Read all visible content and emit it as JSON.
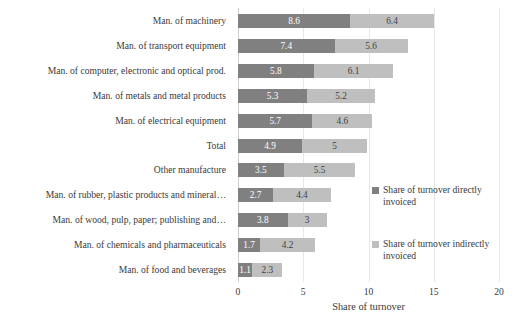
{
  "chart_data": {
    "type": "bar",
    "orientation": "horizontal",
    "stacked": true,
    "title": "",
    "xlabel": "Share of turnover",
    "ylabel": "",
    "xlim": [
      0,
      20
    ],
    "xticks": [
      0,
      5,
      10,
      15,
      20
    ],
    "grid": "vertical",
    "legend_position": "right",
    "categories": [
      "Man. of machinery",
      "Man. of transport equipment",
      "Man. of computer, electronic and optical prod.",
      "Man. of metals and metal products",
      "Man. of electrical equipment",
      "Total",
      "Other manufacture",
      "Man. of rubber, plastic products and mineral…",
      "Man. of wood, pulp, paper; publishing and…",
      "Man. of chemicals and pharmaceuticals",
      "Man. of food and beverages"
    ],
    "series": [
      {
        "name": "Share of turnover directly invoiced",
        "color": "#808080",
        "values": [
          8.6,
          7.4,
          5.8,
          5.3,
          5.7,
          4.9,
          3.5,
          2.7,
          3.8,
          1.7,
          1.1
        ],
        "labels": [
          "8.6",
          "7.4",
          "5.8",
          "5.3",
          "5.7",
          "4.9",
          "3.5",
          "2.7",
          "3.8",
          "1.7",
          "1.1"
        ]
      },
      {
        "name": "Share of turnover indirectly invoiced",
        "color": "#bfbfbf",
        "values": [
          6.4,
          5.6,
          6.1,
          5.2,
          4.6,
          5.0,
          5.5,
          4.4,
          3.0,
          4.2,
          2.3
        ],
        "labels": [
          "6.4",
          "5.6",
          "6.1",
          "5.2",
          "4.6",
          "5",
          "5.5",
          "4.4",
          "3",
          "4.2",
          "2.3"
        ]
      }
    ]
  },
  "legend": {
    "items": [
      {
        "label": "Share of turnover directly invoiced",
        "color": "#808080"
      },
      {
        "label": "Share of turnover indirectly invoiced",
        "color": "#bfbfbf"
      }
    ]
  },
  "axis": {
    "x_title": "Share of turnover",
    "tick_labels": [
      "0",
      "5",
      "10",
      "15",
      "20"
    ]
  }
}
